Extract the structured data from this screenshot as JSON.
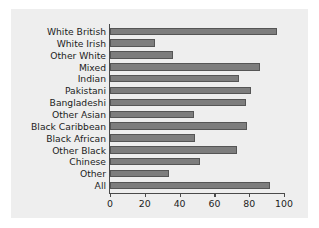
{
  "figure": {
    "background_color": "#eeeeee",
    "page_background_color": "#ffffff",
    "bar_color": "#7d7d7d",
    "bar_edge_color": "#555555",
    "axis_color": "#4a4a4a",
    "text_color": "#1c1c1c"
  },
  "chart_data": {
    "type": "bar",
    "orientation": "horizontal",
    "title": "",
    "subtitle": "",
    "xlabel": "",
    "ylabel": "",
    "xlim": [
      0,
      100
    ],
    "xticks": [
      0,
      20,
      40,
      60,
      80,
      100
    ],
    "xtick_labels": [
      "0",
      "20",
      "40",
      "60",
      "80",
      "100"
    ],
    "grid": false,
    "legend": null,
    "legend_position": "none",
    "categories": [
      "White British",
      "White Irish",
      "Other White",
      "Mixed",
      "Indian",
      "Pakistani",
      "Bangladeshi",
      "Other Asian",
      "Black Caribbean",
      "Black African",
      "Other Black",
      "Chinese",
      "Other",
      "All"
    ],
    "values": [
      96,
      26,
      36,
      86,
      74,
      81,
      78,
      48,
      79,
      49,
      73,
      52,
      34,
      92
    ],
    "annotations": []
  }
}
